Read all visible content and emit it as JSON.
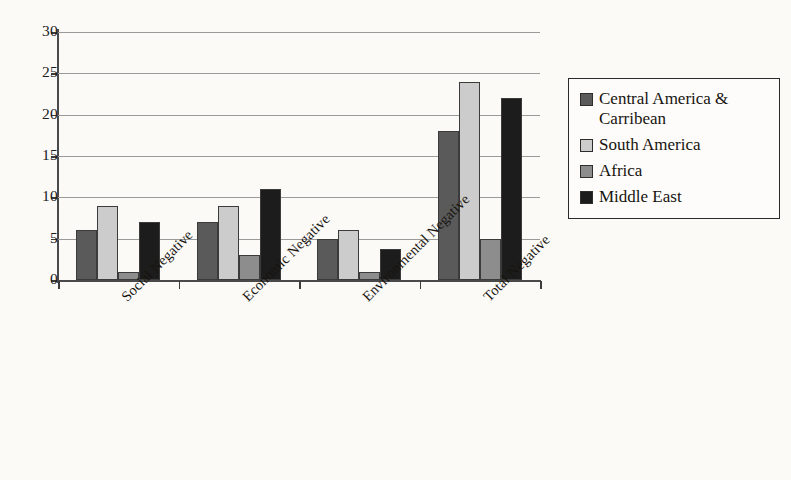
{
  "chart_data": {
    "type": "bar",
    "title": "",
    "subtitle": "",
    "xlabel": "",
    "ylabel": "",
    "ylim": [
      0,
      30
    ],
    "yticks": [
      0,
      5,
      10,
      15,
      20,
      25,
      30
    ],
    "grid": true,
    "legend_position": "right",
    "categories": [
      "Social Negative",
      "Economic Negative",
      "Environmental Negative",
      "Total Negative"
    ],
    "series": [
      {
        "name": "Central America & Carribean",
        "color": "#5a5a5a",
        "values": [
          6,
          7,
          5,
          18
        ]
      },
      {
        "name": "South America",
        "color": "#cccccc",
        "values": [
          9,
          9,
          6,
          24
        ]
      },
      {
        "name": "Africa",
        "color": "#8d8d8d",
        "values": [
          1,
          3,
          1,
          5
        ]
      },
      {
        "name": "Middle East",
        "color": "#1c1c1c",
        "values": [
          7,
          11,
          3.8,
          22
        ]
      }
    ]
  },
  "axis": {
    "y_tick_labels": [
      "0",
      "5",
      "10",
      "15",
      "20",
      "25",
      "30"
    ]
  },
  "legend": {
    "items": [
      {
        "label": "Central America & Carribean",
        "color": "#5a5a5a"
      },
      {
        "label": "South America",
        "color": "#cccccc"
      },
      {
        "label": "Africa",
        "color": "#8d8d8d"
      },
      {
        "label": "Middle East",
        "color": "#1c1c1c"
      }
    ]
  },
  "colors": {
    "background": "#fbfaf7",
    "axis": "#3c3c3c",
    "gridline": "#9a9a9a",
    "text": "#17140f",
    "bar_outline": "#3b3b3b"
  }
}
